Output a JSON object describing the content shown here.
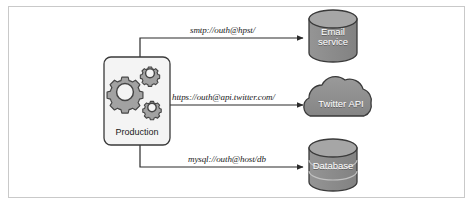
{
  "figure": {
    "background": "#ffffff",
    "frame_color": "#c9c9c9"
  },
  "palette": {
    "shape_fill": "#8d8d8d",
    "shape_fill_light": "#9a9a9a",
    "shape_stroke": "#3a3a3a",
    "box_fill": "#f4f4f4",
    "gear_fill": "#a0a0a0",
    "gear_stroke": "#454545",
    "arrow_color": "#2b2b2b",
    "label_color": "#1a1a1a",
    "on_shape_text": "#ffffff"
  },
  "nodes": {
    "source": {
      "id": "production",
      "label": "Production",
      "icon": "gears-icon",
      "shape": "rounded-rect"
    },
    "targets": [
      {
        "id": "email-service",
        "label_lines": [
          "Email",
          "service"
        ],
        "shape": "cylinder"
      },
      {
        "id": "twitter-api",
        "label_lines": [
          "Twitter API"
        ],
        "shape": "cloud"
      },
      {
        "id": "database",
        "label_lines": [
          "Database"
        ],
        "shape": "cylinder-stacked"
      }
    ]
  },
  "edges": [
    {
      "id": "edge-smtp",
      "from": "production",
      "to": "email-service",
      "label": "smtp://outh@hpst/",
      "route": "elbow-up"
    },
    {
      "id": "edge-https",
      "from": "production",
      "to": "twitter-api",
      "label": "https://outh@api.twitter.com/",
      "route": "straight"
    },
    {
      "id": "edge-mysql",
      "from": "production",
      "to": "database",
      "label": "mysql://outh@host/db",
      "route": "elbow-down"
    }
  ]
}
